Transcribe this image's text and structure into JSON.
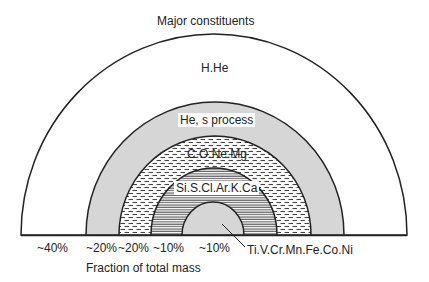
{
  "title": "Major constituents",
  "xlabel": "Fraction of total mass",
  "colors": {
    "line": "#222222",
    "gray_fill": "#d6d6d6",
    "background": "#ffffff"
  },
  "layers": [
    {
      "name": "H.He",
      "fraction": "~40%",
      "fill": "white"
    },
    {
      "name": "He, s process",
      "fraction": "~20%",
      "fill": "gray"
    },
    {
      "name": "C.O.Ne.Mg",
      "fraction": "~20%",
      "fill": "dashed-hatch"
    },
    {
      "name": "Si.S.Cl.Ar.K.Ca",
      "fraction": "~10%",
      "fill": "fine-horizontal-hatch"
    },
    {
      "name": "Ti.V.Cr.Mn.Fe.Co.Ni",
      "fraction": "~10%",
      "fill": "gray"
    }
  ]
}
